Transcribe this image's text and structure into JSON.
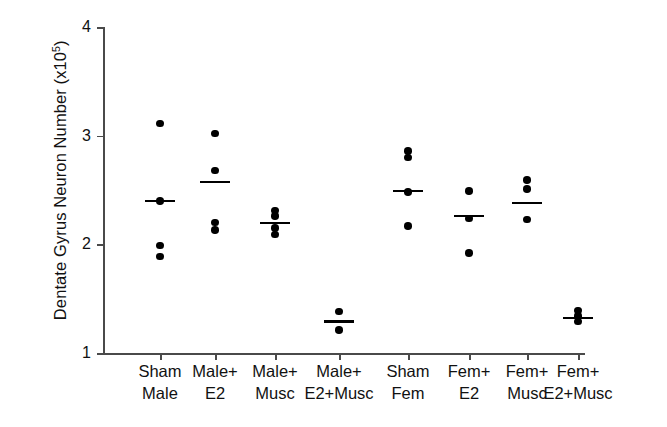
{
  "chart_data": {
    "type": "scatter",
    "title": "",
    "xlabel": "",
    "ylabel": "Dentate Gyrus Neuron Number (x10^5)",
    "ylabel_main": "Dentate Gyrus Neuron Number (x10",
    "ylabel_exp": "5",
    "ylabel_tail": ")",
    "ylim": [
      1,
      4
    ],
    "yticks": [
      1,
      2,
      3,
      4
    ],
    "ytick_labels": [
      "1",
      "2",
      "3",
      "4"
    ],
    "grid": false,
    "legend": "none",
    "units": "x10^5 neurons",
    "marker": "filled-circle",
    "mean_marker": "horizontal-bar",
    "categories": [
      "Sham\nMale",
      "Male+\nE2",
      "Male+\nMusc",
      "Male+\nE2+Musc",
      "Sham\nFem",
      "Fem+\nE2",
      "Fem+\nMusc",
      "Fem+\nE2+Musc"
    ],
    "groups": [
      {
        "label": "Sham Male",
        "mean": 2.4,
        "values": [
          3.11,
          2.4,
          1.99,
          1.89
        ]
      },
      {
        "label": "Male+ E2",
        "mean": 2.57,
        "values": [
          3.02,
          2.68,
          2.2,
          2.13
        ]
      },
      {
        "label": "Male+ Musc",
        "mean": 2.2,
        "values": [
          2.31,
          2.26,
          2.15,
          2.09
        ]
      },
      {
        "label": "Male+ E2+Musc",
        "mean": 1.29,
        "values": [
          1.38,
          1.21
        ]
      },
      {
        "label": "Sham Fem",
        "mean": 2.49,
        "values": [
          2.86,
          2.8,
          2.48,
          2.17
        ]
      },
      {
        "label": "Fem+ E2",
        "mean": 2.26,
        "values": [
          2.49,
          2.24,
          1.92
        ]
      },
      {
        "label": "Fem+ Musc",
        "mean": 2.38,
        "values": [
          2.59,
          2.51,
          2.23
        ]
      },
      {
        "label": "Fem+ E2+Musc",
        "mean": 1.32,
        "values": [
          1.39,
          1.34,
          1.29
        ]
      }
    ]
  }
}
